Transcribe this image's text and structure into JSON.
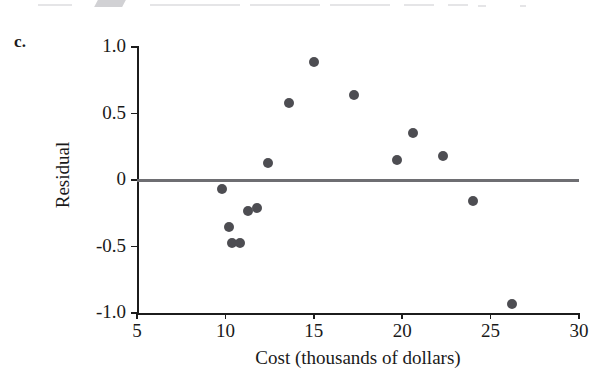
{
  "figure": {
    "panel_letter": "c.",
    "background_color": "#ffffff"
  },
  "chart_data": {
    "type": "scatter",
    "title": "",
    "xlabel": "Cost (thousands of dollars)",
    "ylabel": "Residual",
    "xlim": [
      5,
      30
    ],
    "ylim": [
      -1.0,
      1.0
    ],
    "xticks": [
      5,
      10,
      15,
      20,
      25,
      30
    ],
    "xtick_labels": [
      "5",
      "10",
      "15",
      "20",
      "25",
      "30"
    ],
    "yticks": [
      1.0,
      0.5,
      0,
      -0.5,
      -1.0
    ],
    "ytick_labels": [
      "1.0",
      "0.5",
      "0",
      "-0.5",
      "-1.0"
    ],
    "grid": false,
    "legend": null,
    "reference_line": {
      "type": "horizontal",
      "y": 0,
      "color": "#6e6e72",
      "width_px": 3
    },
    "marker": {
      "shape": "circle",
      "color": "#4d4d52",
      "size_px": 10
    },
    "points": [
      {
        "x": 9.8,
        "y": -0.07
      },
      {
        "x": 10.2,
        "y": -0.35
      },
      {
        "x": 10.4,
        "y": -0.47
      },
      {
        "x": 10.8,
        "y": -0.47
      },
      {
        "x": 11.3,
        "y": -0.23
      },
      {
        "x": 11.8,
        "y": -0.21
      },
      {
        "x": 12.4,
        "y": 0.13
      },
      {
        "x": 13.6,
        "y": 0.58
      },
      {
        "x": 15.0,
        "y": 0.89
      },
      {
        "x": 17.3,
        "y": 0.64
      },
      {
        "x": 19.7,
        "y": 0.15
      },
      {
        "x": 20.6,
        "y": 0.35
      },
      {
        "x": 22.3,
        "y": 0.18
      },
      {
        "x": 24.0,
        "y": -0.16
      },
      {
        "x": 26.2,
        "y": -0.93
      }
    ]
  }
}
